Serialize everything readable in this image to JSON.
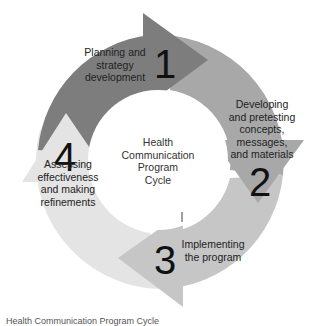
{
  "diagram": {
    "type": "cycle",
    "center_label": [
      "Health",
      "Communication",
      "Program",
      "Cycle"
    ],
    "stages": [
      {
        "number": "1",
        "label": [
          "Planning and",
          "strategy",
          "development"
        ],
        "color": "#7d7d7d"
      },
      {
        "number": "2",
        "label": [
          "Developing",
          "and pretesting",
          "concepts,",
          "messages,",
          "and materials"
        ],
        "color": "#a8a8a8"
      },
      {
        "number": "3",
        "label": [
          "Implementing",
          "the program"
        ],
        "color": "#c6c6c6"
      },
      {
        "number": "4",
        "label": [
          "Assessing",
          "effectiveness",
          "and making",
          "refinements"
        ],
        "color": "#e4e4e4"
      }
    ]
  },
  "caption": "Health Communication Program Cycle"
}
